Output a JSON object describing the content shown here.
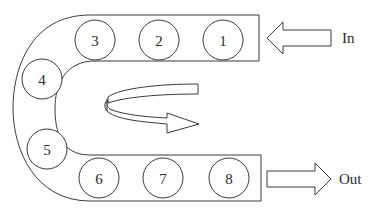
{
  "diagram": {
    "title": "",
    "colors": {
      "line": "#3a3a3a",
      "text": "#2a2a2a",
      "background": "#ffffff"
    },
    "stations": [
      {
        "label": "1",
        "cx": 223,
        "cy": 40
      },
      {
        "label": "2",
        "cx": 159,
        "cy": 40
      },
      {
        "label": "3",
        "cx": 95,
        "cy": 40
      },
      {
        "label": "4",
        "cx": 42,
        "cy": 79
      },
      {
        "label": "5",
        "cx": 47,
        "cy": 149
      },
      {
        "label": "6",
        "cx": 99,
        "cy": 178
      },
      {
        "label": "7",
        "cx": 163,
        "cy": 178
      },
      {
        "label": "8",
        "cx": 229,
        "cy": 178
      }
    ],
    "input_label": "In",
    "output_label": "Out",
    "flow_icon": "u-turn-arrow-icon"
  }
}
